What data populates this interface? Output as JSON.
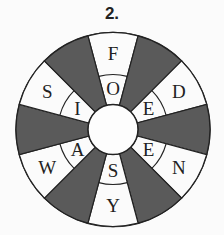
{
  "title": "2.",
  "wheel": {
    "center": [
      113,
      129.5
    ],
    "outer_radius": 97,
    "middle_radius": 55,
    "hub_radius": 25,
    "dark_color": "#5a5a5a",
    "light_color": "#fbfbfb",
    "sectors": [
      {
        "angle": 90,
        "outer": "F",
        "inner": "O",
        "shaded": false
      },
      {
        "angle": 60,
        "shaded": true
      },
      {
        "angle": 30,
        "outer": "D",
        "inner": "E",
        "shaded": false
      },
      {
        "angle": 0,
        "shaded": true
      },
      {
        "angle": -30,
        "outer": "N",
        "inner": "E",
        "shaded": false
      },
      {
        "angle": -60,
        "shaded": true
      },
      {
        "angle": -90,
        "outer": "Y",
        "inner": "S",
        "shaded": false
      },
      {
        "angle": -120,
        "shaded": true
      },
      {
        "angle": -150,
        "outer": "W",
        "inner": "A",
        "shaded": false
      },
      {
        "angle": 180,
        "shaded": true
      },
      {
        "angle": 150,
        "outer": "S",
        "inner": "I",
        "shaded": false
      },
      {
        "angle": 120,
        "shaded": true
      }
    ]
  }
}
